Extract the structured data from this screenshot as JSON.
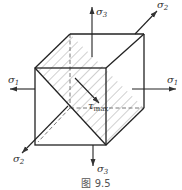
{
  "figure": {
    "caption": "图 9.5",
    "colors": {
      "line": "#333333",
      "hatch": "#666666",
      "background": "#ffffff"
    }
  },
  "labels": {
    "sigma1_left": "σ",
    "sigma1_left_sub": "1",
    "sigma1_right": "σ",
    "sigma1_right_sub": "1",
    "sigma2_top": "σ",
    "sigma2_top_sub": "2",
    "sigma2_bottom": "σ",
    "sigma2_bottom_sub": "2",
    "sigma3_top": "σ",
    "sigma3_top_sub": "3",
    "sigma3_bottom": "σ",
    "sigma3_bottom_sub": "3",
    "tau": "τ",
    "tau_sub": "max"
  }
}
